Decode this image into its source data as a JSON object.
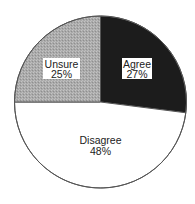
{
  "chart_data": {
    "type": "pie",
    "title": "",
    "categories": [
      "Agree",
      "Disagree",
      "Unsure"
    ],
    "values": [
      27,
      48,
      25
    ],
    "value_labels": [
      "27%",
      "48%",
      "25%"
    ],
    "colors": [
      "#1c1c1c",
      "#ffffff",
      "#a9a9a9"
    ],
    "start_angle_deg": 90,
    "direction": "clockwise",
    "label_boxes": [
      true,
      false,
      true
    ],
    "legend": "none"
  },
  "slices": [
    {
      "name": "Agree",
      "pct": "27%",
      "color": "#1c1c1c"
    },
    {
      "name": "Disagree",
      "pct": "48%",
      "color": "#ffffff"
    },
    {
      "name": "Unsure",
      "pct": "25%",
      "color": "#a9a9a9"
    }
  ],
  "stroke_color": "#555555"
}
